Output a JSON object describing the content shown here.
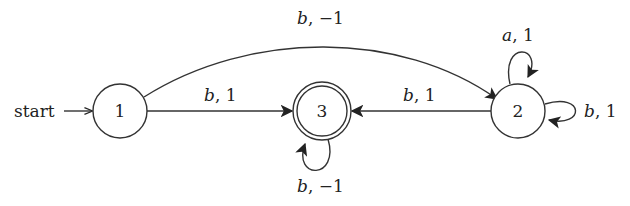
{
  "diagram": {
    "type": "state-machine",
    "start_label": "start",
    "start_state": "1",
    "nodes": [
      {
        "id": "1",
        "label": "1",
        "accepting": false
      },
      {
        "id": "2",
        "label": "2",
        "accepting": false
      },
      {
        "id": "3",
        "label": "3",
        "accepting": true
      }
    ],
    "edges": [
      {
        "from": "1",
        "to": "2",
        "symbol": "b",
        "move": "−1",
        "label": "b, −1"
      },
      {
        "from": "1",
        "to": "3",
        "symbol": "b",
        "move": "1",
        "label": "b, 1"
      },
      {
        "from": "2",
        "to": "3",
        "symbol": "b",
        "move": "1",
        "label": "b, 1"
      },
      {
        "from": "2",
        "to": "2",
        "symbol": "a",
        "move": "1",
        "label": "a, 1",
        "position": "top"
      },
      {
        "from": "2",
        "to": "2",
        "symbol": "b",
        "move": "1",
        "label": "b, 1",
        "position": "right"
      },
      {
        "from": "3",
        "to": "3",
        "symbol": "b",
        "move": "−1",
        "label": "b, −1",
        "position": "bottom"
      }
    ]
  },
  "labels": {
    "start": "start",
    "n1": "1",
    "n2": "2",
    "n3": "3",
    "e12_sym": "b",
    "e12_rest": ", −1",
    "e13_sym": "b",
    "e13_rest": ", 1",
    "e23_sym": "b",
    "e23_rest": ", 1",
    "e22a_sym": "a",
    "e22a_rest": ", 1",
    "e22b_sym": "b",
    "e22b_rest": ", 1",
    "e33_sym": "b",
    "e33_rest": ", −1"
  }
}
